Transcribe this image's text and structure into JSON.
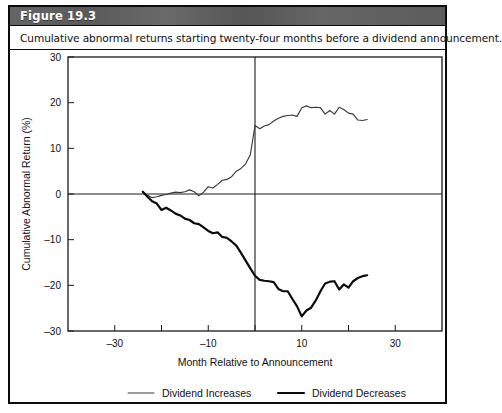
{
  "figure": {
    "label": "Figure 19.3",
    "caption": "Cumulative abnormal returns starting twenty-four months before a dividend announcement."
  },
  "colors": {
    "header_bg": "#5f5f5f",
    "header_text": "#ffffff",
    "border": "#0b0b0b",
    "increases_line": "#3a3a3a",
    "decreases_line": "#0b0b0b",
    "axis": "#1a1a1a",
    "background": "#ffffff"
  },
  "chart_data": {
    "type": "line",
    "title": "Cumulative abnormal returns starting twenty-four months before a dividend announcement.",
    "xlabel": "Month Relative to Announcement",
    "ylabel": "Cumulative Abnormal Return (%)",
    "xlim": [
      -40,
      40
    ],
    "ylim": [
      -30,
      30
    ],
    "xticks_labeled": [
      -30,
      -10,
      10,
      30
    ],
    "xticks_minor": [
      -20,
      0,
      20
    ],
    "yticks": [
      30,
      20,
      10,
      0,
      -10,
      -20,
      -30
    ],
    "grid": false,
    "legend_position": "bottom",
    "annotations": [
      {
        "name": "announcement-line",
        "type": "vline",
        "x": 0
      },
      {
        "name": "zero-line",
        "type": "hline",
        "y": 0
      }
    ],
    "series": [
      {
        "name": "Dividend Increases",
        "style": "thin",
        "color": "#3a3a3a",
        "x": [
          -24,
          -23,
          -22,
          -21,
          -20,
          -19,
          -18,
          -17,
          -16,
          -15,
          -14,
          -13,
          -12,
          -11,
          -10,
          -9,
          -8,
          -7,
          -6,
          -5,
          -4,
          -3,
          -2,
          -1,
          0,
          1,
          2,
          3,
          4,
          5,
          6,
          7,
          8,
          9,
          10,
          11,
          12,
          13,
          14,
          15,
          16,
          17,
          18,
          19,
          20,
          21,
          22,
          23,
          24
        ],
        "y": [
          0.4,
          -0.3,
          -0.8,
          -0.6,
          -0.3,
          -0.1,
          0.2,
          0.4,
          0.3,
          0.5,
          0.9,
          0.5,
          -0.4,
          0.4,
          1.6,
          1.3,
          2.1,
          3.0,
          3.2,
          3.8,
          5.0,
          5.6,
          6.6,
          8.6,
          15.0,
          14.3,
          14.9,
          15.2,
          16.0,
          16.6,
          17.0,
          17.2,
          17.3,
          17.0,
          18.9,
          19.3,
          18.9,
          19.0,
          18.9,
          17.5,
          18.3,
          17.5,
          19.0,
          18.5,
          17.7,
          17.5,
          16.2,
          16.1,
          16.3
        ]
      },
      {
        "name": "Dividend Decreases",
        "style": "thick",
        "color": "#0b0b0b",
        "x": [
          -24,
          -23,
          -22,
          -21,
          -20,
          -19,
          -18,
          -17,
          -16,
          -15,
          -14,
          -13,
          -12,
          -11,
          -10,
          -9,
          -8,
          -7,
          -6,
          -5,
          -4,
          -3,
          -2,
          -1,
          0,
          1,
          2,
          3,
          4,
          5,
          6,
          7,
          8,
          9,
          10,
          11,
          12,
          13,
          14,
          15,
          16,
          17,
          18,
          19,
          20,
          21,
          22,
          23,
          24
        ],
        "y": [
          0.5,
          -0.6,
          -1.6,
          -2.1,
          -3.5,
          -3.0,
          -3.6,
          -4.3,
          -4.7,
          -5.4,
          -5.7,
          -6.4,
          -6.6,
          -7.3,
          -8.1,
          -8.6,
          -8.4,
          -9.4,
          -9.6,
          -10.4,
          -11.3,
          -12.9,
          -14.6,
          -16.3,
          -17.9,
          -18.8,
          -19.0,
          -19.1,
          -19.3,
          -20.8,
          -21.3,
          -21.3,
          -23.0,
          -24.6,
          -26.8,
          -25.5,
          -24.9,
          -23.3,
          -21.3,
          -19.6,
          -19.2,
          -19.1,
          -20.9,
          -19.8,
          -20.5,
          -19.1,
          -18.4,
          -18.0,
          -17.8
        ]
      }
    ]
  },
  "legend": {
    "items": [
      {
        "label": "Dividend Increases",
        "style": "thin"
      },
      {
        "label": "Dividend Decreases",
        "style": "thick"
      }
    ]
  }
}
